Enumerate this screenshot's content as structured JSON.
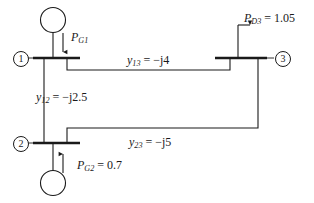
{
  "diagram": {
    "type": "power-system-one-line-diagram",
    "stroke_color": "#1a1a1a",
    "background_color": "#ffffff",
    "buses": [
      {
        "id": "1",
        "number": "1",
        "label_position": "left"
      },
      {
        "id": "2",
        "number": "2",
        "label_position": "left"
      },
      {
        "id": "3",
        "number": "3",
        "label_position": "right"
      }
    ],
    "generators": [
      {
        "id": "G1",
        "bus": "1",
        "symbol": "circle",
        "arrow_direction": "down",
        "label_name": "P",
        "label_subscript": "G1",
        "label_equals": "",
        "label_value": "",
        "label_full": "PG1"
      },
      {
        "id": "G2",
        "bus": "2",
        "symbol": "circle",
        "arrow_direction": "up",
        "label_name": "P",
        "label_subscript": "G2",
        "label_equals": " = ",
        "label_value": "0.7",
        "label_full": "PG2 = 0.7"
      }
    ],
    "loads": [
      {
        "id": "D3",
        "bus": "3",
        "arrow_direction": "right",
        "label_name": "P",
        "label_subscript": "D3",
        "label_equals": " = ",
        "label_value": "1.05",
        "label_full": "PD3 = 1.05"
      }
    ],
    "lines": [
      {
        "id": "line-1-3",
        "from_bus": "1",
        "to_bus": "3",
        "label_name": "y",
        "label_subscript": "13",
        "label_equals": " = ",
        "label_value": "−j4",
        "label_full": "y13 = −j4"
      },
      {
        "id": "line-1-2",
        "from_bus": "1",
        "to_bus": "2",
        "label_name": "y",
        "label_subscript": "12",
        "label_equals": " = ",
        "label_value": "−j2.5",
        "label_full": "y12 = −j2.5"
      },
      {
        "id": "line-2-3",
        "from_bus": "2",
        "to_bus": "3",
        "label_name": "y",
        "label_subscript": "23",
        "label_equals": " = ",
        "label_value": "−j5",
        "label_full": "y23 = −j5"
      }
    ]
  }
}
